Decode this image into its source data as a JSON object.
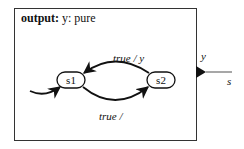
{
  "actor": {
    "declaration_keyword": "output:",
    "declaration_rest": " y: pure",
    "output_port": {
      "name": "y",
      "connection_label": "s"
    }
  },
  "states": [
    {
      "id": "s1",
      "label": "s1",
      "initial": true
    },
    {
      "id": "s2",
      "label": "s2",
      "initial": false
    }
  ],
  "transitions": [
    {
      "from": "s1",
      "to": "s2",
      "guard": "true",
      "output": "",
      "label": "true /"
    },
    {
      "from": "s2",
      "to": "s1",
      "guard": "true",
      "output": "y",
      "label_guard": "true",
      "label_sep": " / ",
      "label_output": "y"
    }
  ],
  "colors": {
    "stroke": "#111111",
    "port_line": "#777777",
    "border": "#333333",
    "background": "#ffffff"
  }
}
